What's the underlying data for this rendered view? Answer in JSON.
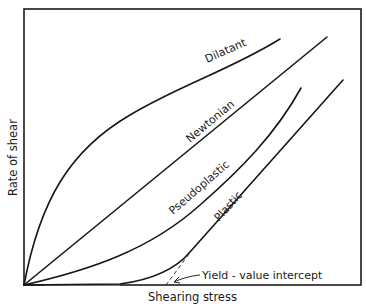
{
  "diagram": {
    "type": "rheology flow curves",
    "x_axis_label": "Shearing stress",
    "y_axis_label": "Rate of shear",
    "curves": [
      {
        "name": "Dilatant",
        "label": "Dilatant",
        "shape": "concave-down from origin"
      },
      {
        "name": "Newtonian",
        "label": "Newtonian",
        "shape": "straight line through origin"
      },
      {
        "name": "Pseudoplastic",
        "label": "Pseudoplastic",
        "shape": "concave-up from origin"
      },
      {
        "name": "Plastic",
        "label": "Plastic",
        "shape": "starts at yield stress, then linear"
      }
    ],
    "annotations": [
      {
        "id": "yield",
        "text": "Yield - value intercept"
      }
    ],
    "colors": {
      "line": "#161616",
      "background": "#ffffff",
      "baseline_tint": "#5fd35f"
    }
  }
}
